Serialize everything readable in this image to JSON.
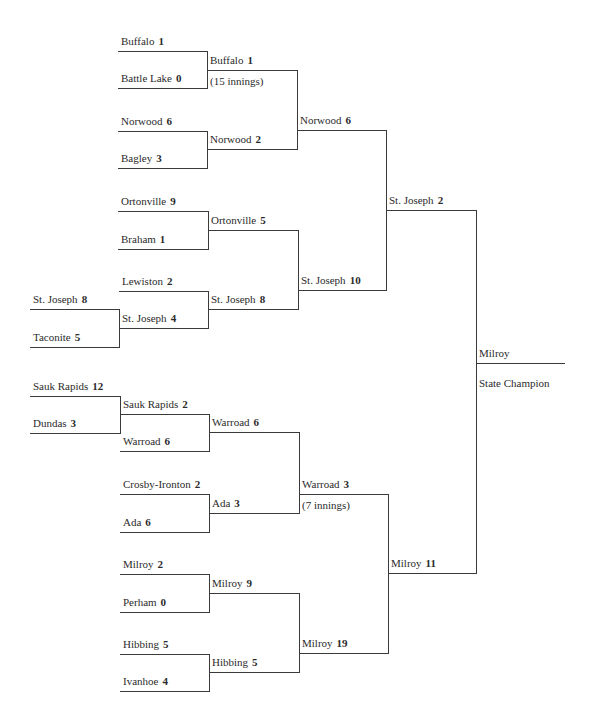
{
  "champion": {
    "team": "Milroy",
    "caption": "State Champion"
  },
  "colors": {
    "text": "#2b2b2b",
    "lines": "#3a3a3a",
    "background": "#ffffff"
  },
  "entries": [
    {
      "id": "r0_sj8",
      "team": "St. Joseph",
      "score": "8",
      "x": 30,
      "x2": 119,
      "y": 309
    },
    {
      "id": "r0_tac",
      "team": "Taconite",
      "score": "5",
      "x": 30,
      "x2": 119,
      "y": 347
    },
    {
      "id": "r0_sr12",
      "team": "Sauk Rapids",
      "score": "12",
      "x": 30,
      "x2": 120,
      "y": 396
    },
    {
      "id": "r0_dun",
      "team": "Dundas",
      "score": "3",
      "x": 30,
      "x2": 120,
      "y": 433
    },
    {
      "id": "r1_buf",
      "team": "Buffalo",
      "score": "1",
      "x": 118,
      "x2": 207,
      "y": 51
    },
    {
      "id": "r1_bl",
      "team": "Battle Lake",
      "score": "0",
      "x": 118,
      "x2": 207,
      "y": 88
    },
    {
      "id": "r1_nor",
      "team": "Norwood",
      "score": "6",
      "x": 118,
      "x2": 207,
      "y": 131
    },
    {
      "id": "r1_bag",
      "team": "Bagley",
      "score": "3",
      "x": 118,
      "x2": 207,
      "y": 168
    },
    {
      "id": "r1_ort",
      "team": "Ortonville",
      "score": "9",
      "x": 118,
      "x2": 208,
      "y": 211
    },
    {
      "id": "r1_bra",
      "team": "Braham",
      "score": "1",
      "x": 118,
      "x2": 208,
      "y": 249
    },
    {
      "id": "r1_lew",
      "team": "Lewiston",
      "score": "2",
      "x": 119,
      "x2": 208,
      "y": 291
    },
    {
      "id": "r1_sj4",
      "team": "St. Joseph",
      "score": "4",
      "x": 119,
      "x2": 208,
      "y": 328
    },
    {
      "id": "r1_sr2",
      "team": "Sauk Rapids",
      "score": "2",
      "x": 120,
      "x2": 209,
      "y": 414
    },
    {
      "id": "r1_war6",
      "team": "Warroad",
      "score": "6",
      "x": 120,
      "x2": 209,
      "y": 451
    },
    {
      "id": "r1_cro",
      "team": "Crosby-Ironton",
      "score": "2",
      "x": 120,
      "x2": 209,
      "y": 494
    },
    {
      "id": "r1_ada6",
      "team": "Ada",
      "score": "6",
      "x": 120,
      "x2": 209,
      "y": 532
    },
    {
      "id": "r1_mil2",
      "team": "Milroy",
      "score": "2",
      "x": 120,
      "x2": 209,
      "y": 574
    },
    {
      "id": "r1_per",
      "team": "Perham",
      "score": "0",
      "x": 120,
      "x2": 209,
      "y": 612
    },
    {
      "id": "r1_hib5",
      "team": "Hibbing",
      "score": "5",
      "x": 120,
      "x2": 209,
      "y": 654
    },
    {
      "id": "r1_iva",
      "team": "Ivanhoe",
      "score": "4",
      "x": 120,
      "x2": 209,
      "y": 691
    },
    {
      "id": "r2_buf",
      "team": "Buffalo",
      "score": "1",
      "x": 207,
      "x2": 297,
      "y": 70,
      "note": "(15 innings)"
    },
    {
      "id": "r2_nor",
      "team": "Norwood",
      "score": "2",
      "x": 207,
      "x2": 297,
      "y": 149
    },
    {
      "id": "r2_ort",
      "team": "Ortonville",
      "score": "5",
      "x": 208,
      "x2": 298,
      "y": 230
    },
    {
      "id": "r2_sj8",
      "team": "St. Joseph",
      "score": "8",
      "x": 208,
      "x2": 298,
      "y": 309
    },
    {
      "id": "r2_war6",
      "team": "Warroad",
      "score": "6",
      "x": 209,
      "x2": 299,
      "y": 432
    },
    {
      "id": "r2_ada3",
      "team": "Ada",
      "score": "3",
      "x": 209,
      "x2": 299,
      "y": 513
    },
    {
      "id": "r2_mil9",
      "team": "Milroy",
      "score": "9",
      "x": 209,
      "x2": 299,
      "y": 593
    },
    {
      "id": "r2_hib5",
      "team": "Hibbing",
      "score": "5",
      "x": 209,
      "x2": 299,
      "y": 672
    },
    {
      "id": "r3_nor6",
      "team": "Norwood",
      "score": "6",
      "x": 297,
      "x2": 386,
      "y": 130
    },
    {
      "id": "r3_sj10",
      "team": "St. Joseph",
      "score": "10",
      "x": 298,
      "x2": 386,
      "y": 290
    },
    {
      "id": "r3_war3",
      "team": "Warroad",
      "score": "3",
      "x": 299,
      "x2": 388,
      "y": 494,
      "note": "(7 innings)"
    },
    {
      "id": "r3_mil19",
      "team": "Milroy",
      "score": "19",
      "x": 299,
      "x2": 388,
      "y": 653
    },
    {
      "id": "r4_sj2",
      "team": "St. Joseph",
      "score": "2",
      "x": 386,
      "x2": 476,
      "y": 210
    },
    {
      "id": "r4_mil11",
      "team": "Milroy",
      "score": "11",
      "x": 388,
      "x2": 477,
      "y": 573
    },
    {
      "id": "r5_champ",
      "team": "Milroy",
      "score": "",
      "x": 476,
      "x2": 565,
      "y": 363,
      "note": "State Champion"
    }
  ],
  "connectors": [
    {
      "x": 119,
      "y1": 309,
      "y2": 347
    },
    {
      "x": 120,
      "y1": 396,
      "y2": 433
    },
    {
      "x": 207,
      "y1": 51,
      "y2": 88
    },
    {
      "x": 207,
      "y1": 131,
      "y2": 168
    },
    {
      "x": 208,
      "y1": 211,
      "y2": 249
    },
    {
      "x": 208,
      "y1": 291,
      "y2": 328
    },
    {
      "x": 209,
      "y1": 414,
      "y2": 451
    },
    {
      "x": 209,
      "y1": 494,
      "y2": 532
    },
    {
      "x": 209,
      "y1": 574,
      "y2": 612
    },
    {
      "x": 209,
      "y1": 654,
      "y2": 691
    },
    {
      "x": 297,
      "y1": 70,
      "y2": 149
    },
    {
      "x": 298,
      "y1": 230,
      "y2": 309
    },
    {
      "x": 299,
      "y1": 432,
      "y2": 513
    },
    {
      "x": 299,
      "y1": 593,
      "y2": 672
    },
    {
      "x": 386,
      "y1": 130,
      "y2": 290
    },
    {
      "x": 388,
      "y1": 494,
      "y2": 653
    },
    {
      "x": 476,
      "y1": 210,
      "y2": 573
    }
  ]
}
